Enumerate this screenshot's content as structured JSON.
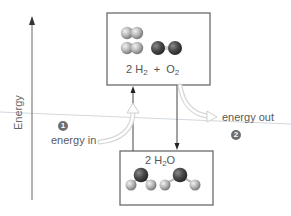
{
  "diagram": {
    "axis": {
      "label": "Energy",
      "direction": "up"
    },
    "reactants_box": {
      "formula_parts": {
        "coef_h2": "2 H",
        "sub_h2": "2",
        "plus": "+",
        "o2": "O",
        "sub_o2": "2"
      },
      "molecules": [
        "H2",
        "H2",
        "O2"
      ]
    },
    "products_box": {
      "formula_parts": {
        "coef": "2 H",
        "sub": "2",
        "tail": "O"
      },
      "molecules": [
        "H2O",
        "H2O"
      ]
    },
    "steps": [
      {
        "number": "1",
        "label": "energy in"
      },
      {
        "number": "2",
        "label": "energy out"
      }
    ],
    "colors": {
      "box_border": "#6b6b6b",
      "hydrogen": "#b5b5b5",
      "oxygen": "#4a4a4a",
      "badge": "#6e6e6e",
      "reference_line": "#d0d6dc",
      "energy_arrow": "#e3e3e3"
    }
  }
}
